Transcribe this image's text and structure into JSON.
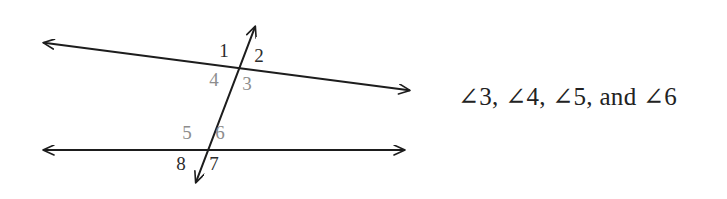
{
  "figure": {
    "name": "parallel-lines-transversal-diagram",
    "background_color": "#ffffff",
    "line_color": "#1d1d1d",
    "label_dark_color": "#2b2b2b",
    "label_light_color": "#8d8d8d",
    "lines": [
      {
        "name": "upper-line",
        "type": "double-arrow-line",
        "x1": 38,
        "y1": 42,
        "x2": 415,
        "y2": 91
      },
      {
        "name": "lower-line",
        "type": "double-arrow-line",
        "x1": 38,
        "y1": 150,
        "x2": 410,
        "y2": 150
      },
      {
        "name": "transversal-line",
        "type": "double-arrow-line",
        "x1": 259,
        "y1": 17,
        "x2": 193,
        "y2": 190
      }
    ],
    "intersections": [
      {
        "name": "upper-intersection",
        "x": 238,
        "y": 69
      },
      {
        "name": "lower-intersection",
        "x": 203,
        "y": 150
      }
    ],
    "angle_labels": [
      {
        "id": "1",
        "text": "1",
        "x": 224,
        "y": 57,
        "tone": "dark"
      },
      {
        "id": "2",
        "text": "2",
        "x": 259,
        "y": 62,
        "tone": "dark"
      },
      {
        "id": "3",
        "text": "3",
        "x": 247,
        "y": 90,
        "tone": "light"
      },
      {
        "id": "4",
        "text": "4",
        "x": 214,
        "y": 86,
        "tone": "light"
      },
      {
        "id": "5",
        "text": "5",
        "x": 187,
        "y": 139,
        "tone": "light"
      },
      {
        "id": "6",
        "text": "6",
        "x": 220,
        "y": 139,
        "tone": "light"
      },
      {
        "id": "7",
        "text": "7",
        "x": 214,
        "y": 170,
        "tone": "dark"
      },
      {
        "id": "8",
        "text": "8",
        "x": 181,
        "y": 170,
        "tone": "dark"
      }
    ]
  },
  "answer": {
    "label": "angle-list-answer",
    "text": "∠3, ∠4, ∠5, and ∠6",
    "angles": [
      "∠3",
      "∠4",
      "∠5",
      "∠6"
    ],
    "conjunction": "and"
  }
}
